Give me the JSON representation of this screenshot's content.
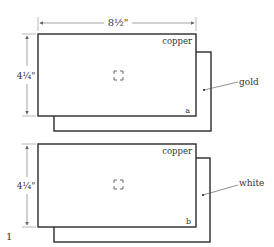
{
  "figure_number": "1",
  "width_dimension": "8½\"",
  "panels": [
    {
      "id": "a",
      "height_dimension": "4¼\"",
      "front_label": "copper",
      "back_label": "gold",
      "corner_letter": "a"
    },
    {
      "id": "b",
      "height_dimension": "4¼\"",
      "front_label": "copper",
      "back_label": "white",
      "corner_letter": "b"
    }
  ],
  "colors": {
    "stroke": "#2a2a2a",
    "dim": "#666666"
  }
}
